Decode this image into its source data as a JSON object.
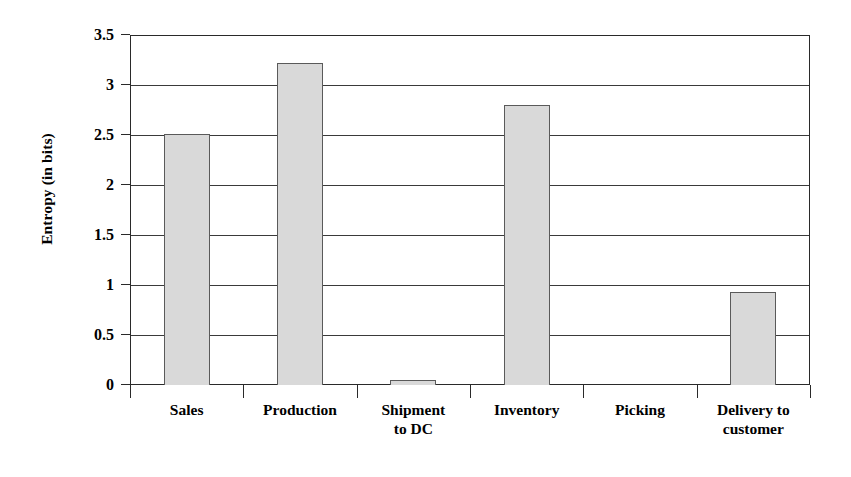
{
  "chart_data": {
    "type": "bar",
    "title": "",
    "xlabel": "",
    "ylabel": "Entropy (in bits)",
    "categories": [
      "Sales",
      "Production",
      "Shipment to DC",
      "Inventory",
      "Picking",
      "Delivery to customer"
    ],
    "values": [
      2.51,
      3.22,
      0.05,
      2.8,
      0,
      0.93
    ],
    "ylim": [
      0,
      3.5
    ],
    "ytick_labels": [
      "0",
      "0.5",
      "1",
      "1.5",
      "2",
      "2.5",
      "3",
      "3.5"
    ],
    "ytick_values": [
      0,
      0.5,
      1,
      1.5,
      2,
      2.5,
      3,
      3.5
    ],
    "grid": true,
    "legend": "none",
    "bar_fill_color": "#d9d9d9",
    "bar_border_color": "#5a5a5a",
    "axis_color": "#2a2a2a"
  },
  "axis": {
    "y_title": "Entropy (in bits)"
  },
  "category_labels": [
    {
      "line1": "Sales",
      "line2": ""
    },
    {
      "line1": "Production",
      "line2": ""
    },
    {
      "line1": "Shipment",
      "line2": "to DC"
    },
    {
      "line1": "Inventory",
      "line2": ""
    },
    {
      "line1": "Picking",
      "line2": ""
    },
    {
      "line1": "Delivery to",
      "line2": "customer"
    }
  ]
}
